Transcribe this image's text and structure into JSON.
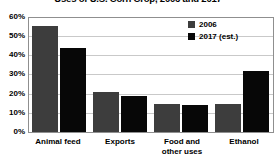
{
  "chart_data": {
    "type": "bar",
    "title": "Uses of U.S. Corn Crop, 2006 and 2017",
    "xlabel": "",
    "ylabel": "",
    "ylim": [
      0,
      60
    ],
    "yunit": "%",
    "grid": true,
    "legend_position": "top-right",
    "categories": [
      "Animal feed",
      "Exports",
      "Food and other uses",
      "Ethanol"
    ],
    "category_lines": [
      [
        "Animal feed"
      ],
      [
        "Exports"
      ],
      [
        "Food and",
        "other uses"
      ],
      [
        "Ethanol"
      ]
    ],
    "ytick_labels": [
      "60%",
      "50%",
      "40%",
      "30%",
      "20%",
      "10%",
      "0%"
    ],
    "ytick_values": [
      60,
      50,
      40,
      30,
      20,
      10,
      0
    ],
    "series": [
      {
        "name": "2006",
        "color": "#3d3d3d",
        "values": [
          56,
          21,
          15,
          15
        ]
      },
      {
        "name": "2017 (est.)",
        "color": "#070707",
        "values": [
          44,
          19,
          14,
          32
        ]
      }
    ]
  },
  "title": {
    "text": "Uses of U.S. Corn Crop, 2006 and 2017"
  },
  "legend": {
    "items": [
      {
        "label": "2006",
        "color": "#3d3d3d"
      },
      {
        "label": "2017 (est.)",
        "color": "#070707"
      }
    ]
  },
  "yaxis": {
    "ticks": [
      {
        "label": "60%",
        "value": 60
      },
      {
        "label": "50%",
        "value": 50
      },
      {
        "label": "40%",
        "value": 40
      },
      {
        "label": "30%",
        "value": 30
      },
      {
        "label": "20%",
        "value": 20
      },
      {
        "label": "10%",
        "value": 10
      },
      {
        "label": "0%",
        "value": 0
      }
    ]
  },
  "xaxis": {
    "labels": [
      {
        "line1": "Animal feed",
        "line2": ""
      },
      {
        "line1": "Exports",
        "line2": ""
      },
      {
        "line1": "Food and",
        "line2": "other uses"
      },
      {
        "line1": "Ethanol",
        "line2": ""
      }
    ]
  }
}
